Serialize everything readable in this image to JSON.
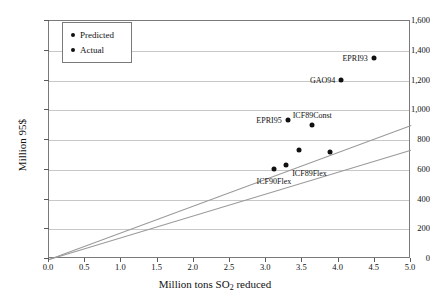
{
  "chart_data": {
    "type": "scatter",
    "title": "",
    "xlabel": "Million tons SO2 reduced",
    "ylabel": "Million 95$",
    "xlim": [
      0.0,
      5.0
    ],
    "ylim": [
      0,
      1600
    ],
    "xticks": [
      "0.0",
      "0.5",
      "1.0",
      "1.5",
      "2.0",
      "2.5",
      "3.0",
      "3.5",
      "4.0",
      "4.5",
      "5.0"
    ],
    "xtick_values": [
      0.0,
      0.5,
      1.0,
      1.5,
      2.0,
      2.5,
      3.0,
      3.5,
      4.0,
      4.5,
      5.0
    ],
    "yticks": [
      "0",
      "200",
      "400",
      "600",
      "800",
      "1,000",
      "1,200",
      "1,400",
      "1,600"
    ],
    "ytick_values": [
      0,
      200,
      400,
      600,
      800,
      1000,
      1200,
      1400,
      1600
    ],
    "grid": "horizontal",
    "legend_position": "top-left",
    "legend": [
      {
        "label": "Predicted",
        "marker": "dot"
      },
      {
        "label": "Actual",
        "marker": "dot"
      }
    ],
    "points": [
      {
        "label": "EPRI93",
        "x": 4.5,
        "y": 1345,
        "label_pos": "left"
      },
      {
        "label": "GAO94",
        "x": 4.05,
        "y": 1197,
        "label_pos": "left"
      },
      {
        "label": "EPRI95",
        "x": 3.31,
        "y": 928,
        "label_pos": "left"
      },
      {
        "label": "ICF89Const",
        "x": 3.65,
        "y": 895,
        "label_pos": "above"
      },
      {
        "label": "",
        "x": 3.46,
        "y": 726,
        "label_pos": "none"
      },
      {
        "label": "",
        "x": 3.9,
        "y": 712,
        "label_pos": "none"
      },
      {
        "label": "ICF89Flex",
        "x": 3.29,
        "y": 625,
        "label_pos": "belowright"
      },
      {
        "label": "ICF90Flex",
        "x": 3.12,
        "y": 600,
        "label_pos": "below"
      }
    ],
    "trendlines": [
      {
        "name": "upper-line",
        "x0": 0.0,
        "y0": 0,
        "x1": 5.0,
        "y1": 900
      },
      {
        "name": "lower-line",
        "x0": 0.0,
        "y0": 0,
        "x1": 5.0,
        "y1": 735
      }
    ]
  }
}
